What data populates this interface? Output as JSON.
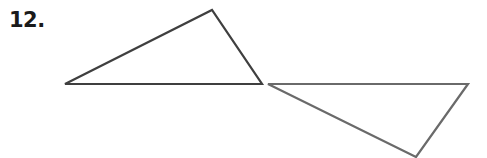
{
  "problem": {
    "number_label": "12."
  },
  "figures": {
    "triangle_a": {
      "points": "65,84 212,10 262,84",
      "stroke": "#3f3f3f"
    },
    "triangle_b": {
      "points": "268,84 468,84 416,157",
      "stroke": "#6a6a6a"
    }
  }
}
